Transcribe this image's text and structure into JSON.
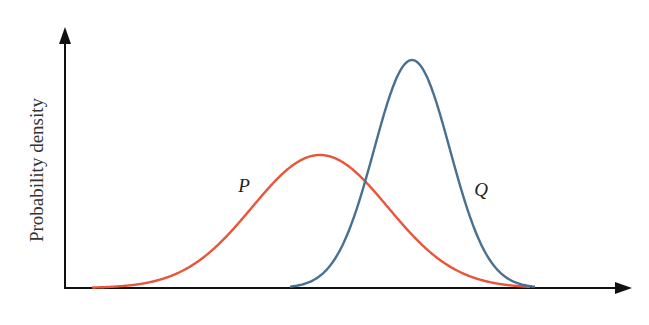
{
  "chart_data": {
    "type": "line",
    "title": "",
    "xlabel": "",
    "ylabel": "Probability density",
    "grid": false,
    "legend": "inline labels",
    "axes": {
      "x_ticks": [],
      "y_ticks": [],
      "arrows": true
    },
    "xlim": [
      65,
      632
    ],
    "ylim": [
      0,
      228
    ],
    "series": [
      {
        "name": "P",
        "color": "#E8553A",
        "distribution": "gaussian",
        "mean_px": 320,
        "sigma_px": 68,
        "peak_height_px": 133,
        "x_start_px": 92,
        "x_end_px": 530
      },
      {
        "name": "Q",
        "color": "#4A7090",
        "distribution": "gaussian",
        "mean_px": 412,
        "sigma_px": 38,
        "peak_height_px": 228,
        "x_start_px": 290,
        "x_end_px": 535
      }
    ]
  },
  "labels": {
    "y_axis": "Probability density",
    "p": "P",
    "q": "Q"
  },
  "geometry": {
    "origin_x": 65,
    "baseline_y": 288,
    "y_axis_top": 27,
    "x_axis_right": 632,
    "p_label_pos": [
      244,
      186
    ],
    "q_label_pos": [
      481,
      190
    ]
  },
  "colors": {
    "axis": "#111111",
    "p": "#E8553A",
    "q": "#4A7090"
  }
}
